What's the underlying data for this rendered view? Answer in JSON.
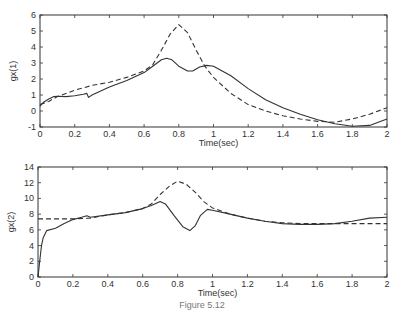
{
  "chart_data": [
    {
      "type": "line",
      "title": "",
      "xlabel": "Time(sec)",
      "ylabel": "gx(1)",
      "xlim": [
        0,
        2
      ],
      "ylim": [
        -1,
        6
      ],
      "xticks": [
        "0",
        "0.2",
        "0.4",
        "0.6",
        "0.8",
        "1",
        "1.2",
        "1.4",
        "1.6",
        "1.8",
        "2"
      ],
      "yticks": [
        "-1",
        "0",
        "1",
        "2",
        "3",
        "4",
        "5",
        "6"
      ],
      "grid": false,
      "legend": null,
      "series": [
        {
          "name": "actual",
          "style": "solid",
          "x": [
            0,
            0.02,
            0.05,
            0.08,
            0.1,
            0.15,
            0.2,
            0.25,
            0.27,
            0.28,
            0.3,
            0.4,
            0.5,
            0.6,
            0.65,
            0.7,
            0.73,
            0.76,
            0.8,
            0.85,
            0.88,
            0.92,
            0.96,
            1.0,
            1.1,
            1.2,
            1.3,
            1.4,
            1.5,
            1.6,
            1.7,
            1.8,
            1.9,
            2.0
          ],
          "y": [
            0.3,
            0.55,
            0.75,
            0.9,
            0.92,
            0.9,
            0.95,
            1.05,
            1.1,
            0.85,
            1.0,
            1.5,
            1.9,
            2.4,
            2.8,
            3.2,
            3.3,
            3.2,
            2.8,
            2.5,
            2.5,
            2.75,
            2.85,
            2.8,
            2.2,
            1.4,
            0.7,
            0.2,
            -0.2,
            -0.55,
            -0.8,
            -0.95,
            -0.9,
            -0.5
          ]
        },
        {
          "name": "desired",
          "style": "dashed",
          "x": [
            0,
            0.05,
            0.1,
            0.2,
            0.3,
            0.4,
            0.5,
            0.6,
            0.65,
            0.7,
            0.75,
            0.8,
            0.85,
            0.9,
            0.95,
            1.0,
            1.1,
            1.2,
            1.3,
            1.4,
            1.5,
            1.6,
            1.7,
            1.8,
            1.9,
            2.0
          ],
          "y": [
            0.4,
            0.6,
            0.9,
            1.3,
            1.6,
            1.8,
            2.1,
            2.5,
            2.9,
            3.8,
            4.8,
            5.4,
            4.9,
            3.8,
            2.8,
            2.1,
            1.1,
            0.4,
            0.0,
            -0.3,
            -0.5,
            -0.65,
            -0.7,
            -0.5,
            -0.2,
            0.2
          ]
        }
      ]
    },
    {
      "type": "line",
      "title": "",
      "xlabel": "Time(sec)",
      "ylabel": "gx(2)",
      "xlim": [
        0,
        2
      ],
      "ylim": [
        0,
        14
      ],
      "xticks": [
        "0",
        "0.2",
        "0.4",
        "0.6",
        "0.8",
        "1",
        "1.2",
        "1.4",
        "1.6",
        "1.8",
        "2"
      ],
      "yticks": [
        "0",
        "2",
        "4",
        "6",
        "8",
        "10",
        "12",
        "14"
      ],
      "grid": false,
      "legend": null,
      "series": [
        {
          "name": "actual",
          "style": "solid",
          "x": [
            0,
            0.01,
            0.02,
            0.03,
            0.05,
            0.1,
            0.15,
            0.2,
            0.25,
            0.28,
            0.3,
            0.4,
            0.5,
            0.6,
            0.65,
            0.7,
            0.73,
            0.78,
            0.83,
            0.87,
            0.9,
            0.93,
            0.97,
            1.0,
            1.1,
            1.2,
            1.3,
            1.4,
            1.5,
            1.6,
            1.7,
            1.8,
            1.9,
            2.0
          ],
          "y": [
            0,
            2,
            4,
            5,
            5.9,
            6.2,
            6.8,
            7.3,
            7.6,
            7.8,
            7.6,
            7.9,
            8.2,
            8.7,
            9.1,
            9.6,
            9.3,
            7.8,
            6.4,
            5.9,
            6.5,
            7.8,
            8.6,
            8.5,
            8.0,
            7.5,
            7.1,
            6.8,
            6.7,
            6.7,
            6.8,
            7.1,
            7.5,
            7.6
          ]
        },
        {
          "name": "desired",
          "style": "dashed",
          "x": [
            0,
            0.1,
            0.2,
            0.3,
            0.4,
            0.5,
            0.6,
            0.65,
            0.7,
            0.75,
            0.8,
            0.85,
            0.9,
            0.95,
            1.0,
            1.1,
            1.2,
            1.3,
            1.4,
            1.5,
            1.6,
            1.7,
            1.8,
            1.9,
            2.0
          ],
          "y": [
            7.4,
            7.4,
            7.4,
            7.5,
            7.9,
            8.2,
            8.7,
            9.3,
            10.5,
            11.5,
            12.2,
            11.8,
            10.8,
            9.6,
            8.8,
            8.0,
            7.5,
            7.1,
            6.9,
            6.8,
            6.8,
            6.8,
            6.8,
            6.8,
            6.8
          ]
        }
      ]
    }
  ],
  "caption": "Figure 5.12"
}
